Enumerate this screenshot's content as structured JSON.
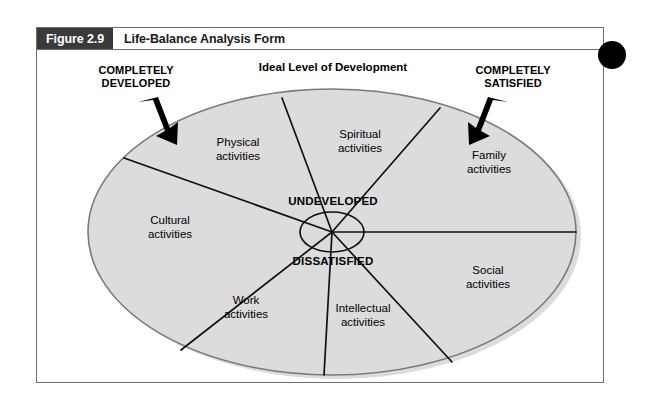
{
  "figure": {
    "number_label": "Figure 2.9",
    "title": "Life-Balance Analysis Form"
  },
  "diagram": {
    "top_heading": "Ideal Level of Development",
    "callouts": [
      {
        "id": "completely-developed",
        "text": "COMPLETELY\nDEVELOPED"
      },
      {
        "id": "completely-satisfied",
        "text": "COMPLETELY\nSATISFIED"
      }
    ],
    "center_labels": [
      {
        "id": "undeveloped",
        "text": "UNDEVELOPED"
      },
      {
        "id": "dissatisfied",
        "text": "DISSATISFIED"
      }
    ],
    "sectors": [
      {
        "id": "physical",
        "text": "Physical\nactivities"
      },
      {
        "id": "spiritual",
        "text": "Spiritual\nactivities"
      },
      {
        "id": "family",
        "text": "Family\nactivities"
      },
      {
        "id": "social",
        "text": "Social\nactivities"
      },
      {
        "id": "intellectual",
        "text": "Intellectual\nactivities"
      },
      {
        "id": "work",
        "text": "Work\nactivities"
      },
      {
        "id": "cultural",
        "text": "Cultural\nactivities"
      }
    ]
  },
  "colors": {
    "ellipse_fill": "#dcdcdc",
    "ellipse_stroke": "#7a7a7a",
    "frame_stroke": "#6d6d6d",
    "fig_box_bg": "#3a3a3a",
    "line": "#111111",
    "dot": "#000000"
  }
}
